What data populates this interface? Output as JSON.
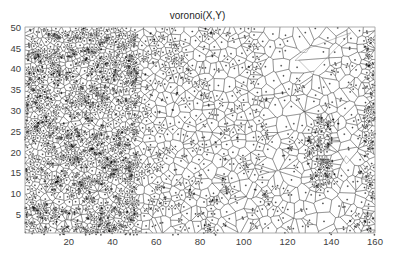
{
  "chart_data": {
    "type": "scatter",
    "subtype": "voronoi-diagram",
    "title": "voronoi(X,Y)",
    "xlabel": "",
    "ylabel": "",
    "xlim": [
      0,
      160
    ],
    "ylim": [
      0.7,
      50.2
    ],
    "xticks": [
      20,
      40,
      60,
      80,
      100,
      120,
      140,
      160
    ],
    "yticks": [
      5,
      10,
      15,
      20,
      25,
      30,
      35,
      40,
      45,
      50
    ],
    "grid": false,
    "legend": null,
    "edge_color": "#1a1a1a",
    "seed_marker": "+",
    "density_regions": [
      {
        "name": "dense-left",
        "x": [
          0,
          52
        ],
        "y": [
          0,
          50
        ],
        "points_per_unit2": 0.55
      },
      {
        "name": "medium-center",
        "x": [
          52,
          110
        ],
        "y": [
          0,
          50
        ],
        "points_per_unit2": 0.18
      },
      {
        "name": "sparse-right",
        "x": [
          110,
          155
        ],
        "y": [
          0,
          50
        ],
        "points_per_unit2": 0.09
      },
      {
        "name": "dense-right-edge",
        "x": [
          155,
          160
        ],
        "y": [
          0,
          50
        ],
        "points_per_unit2": 0.5
      },
      {
        "name": "cluster-main",
        "center": [
          135,
          20
        ],
        "radius": [
          6,
          10
        ],
        "points_per_unit2": 0.55
      },
      {
        "name": "cluster-small",
        "center": [
          121,
          21.5
        ],
        "radius": [
          1.2,
          1.2
        ],
        "points_per_unit2": 0.6
      }
    ]
  },
  "axes": {
    "title": "voronoi(X,Y)",
    "x_tick_labels": [
      "20",
      "40",
      "60",
      "80",
      "100",
      "120",
      "140",
      "160"
    ],
    "y_tick_labels": [
      "5",
      "10",
      "15",
      "20",
      "25",
      "30",
      "35",
      "40",
      "45",
      "50"
    ]
  }
}
